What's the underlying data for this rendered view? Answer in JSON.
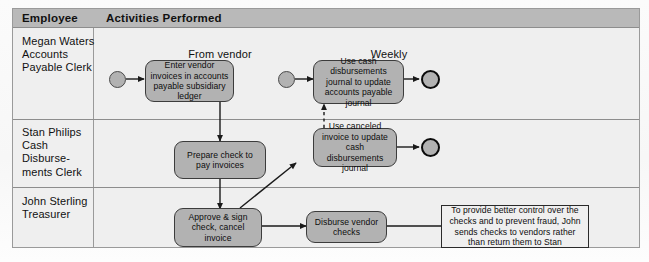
{
  "table": {
    "headers": {
      "employee": "Employee",
      "activities": "Activities Performed"
    },
    "rows": [
      {
        "employee": "Megan Waters\nAccounts\nPayable Clerk"
      },
      {
        "employee": "Stan Philips\nCash Disburse-\nments Clerk"
      },
      {
        "employee": "John Sterling\nTreasurer"
      }
    ]
  },
  "flow": {
    "captions": [
      {
        "id": "from-vendor",
        "text": "From vendor"
      },
      {
        "id": "weekly",
        "text": "Weekly"
      }
    ],
    "activities": [
      {
        "id": "enter-vendor-invoices",
        "text": "Enter vendor invoices in accounts payable subsidiary ledger"
      },
      {
        "id": "use-cash-disbursements-journal",
        "text": "Use cash disbursements journal to update accounts payable journal"
      },
      {
        "id": "prepare-check",
        "text": "Prepare check to pay invoices"
      },
      {
        "id": "use-canceled-invoice",
        "text": "Use canceled invoice to update cash disbursements journal"
      },
      {
        "id": "approve-sign-check",
        "text": "Approve & sign check, cancel invoice"
      },
      {
        "id": "disburse-vendor-checks",
        "text": "Disburse vendor checks"
      }
    ],
    "note": {
      "id": "control-note",
      "text": "To provide better control over the checks and to prevent fraud, John sends checks to vendors rather than return them to Stan"
    },
    "terminators": [
      {
        "id": "start-1",
        "kind": "start"
      },
      {
        "id": "start-2",
        "kind": "start"
      },
      {
        "id": "end-1",
        "kind": "end"
      },
      {
        "id": "end-2",
        "kind": "end"
      }
    ]
  },
  "colors": {
    "header_bar": "#b9b9b9",
    "table_body": "#efefef",
    "activity_fill": "#b2b2b2",
    "activity_stroke": "#3c3c3c",
    "connector": "#1a1a1a",
    "grid_line": "#8d8d8d"
  }
}
